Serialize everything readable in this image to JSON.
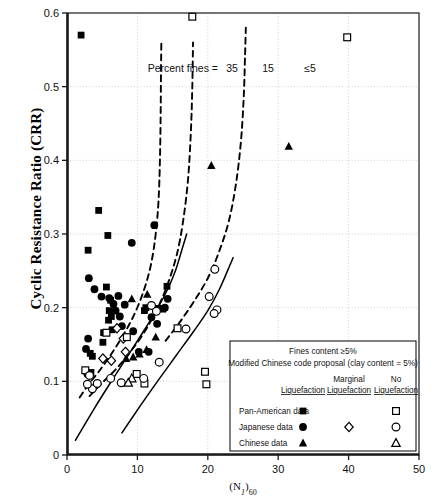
{
  "chart_data": {
    "type": "scatter",
    "title": "",
    "xlabel": "(N1)60",
    "ylabel": "Cyclic Resistance Ratio (CRR)",
    "xlim": [
      0,
      50
    ],
    "ylim": [
      0,
      0.6
    ],
    "xticks": [
      "0",
      "10",
      "20",
      "30",
      "40",
      "50"
    ],
    "xtick_values": [
      0,
      10,
      20,
      30,
      40,
      50
    ],
    "yticks": [
      "0",
      "0.1",
      "0.2",
      "0.3",
      "0.4",
      "0.5",
      "0.6"
    ],
    "ytick_values": [
      0,
      0.1,
      0.2,
      0.3,
      0.4,
      0.5,
      0.6
    ],
    "grid": "dotted-minor",
    "legend_position": "inside-lower-right",
    "annotations": {
      "percent_fines_label": "Percent fines =",
      "curve_labels": [
        "35",
        "15",
        "≤5"
      ]
    },
    "series": [
      {
        "name": "Pan-American data — Liquefaction",
        "marker": "filled-square",
        "points": [
          [
            2.0,
            0.57
          ],
          [
            4.5,
            0.332
          ],
          [
            5.8,
            0.298
          ],
          [
            3.0,
            0.278
          ],
          [
            5.6,
            0.228
          ],
          [
            6.2,
            0.21
          ],
          [
            6.0,
            0.196
          ],
          [
            6.3,
            0.188
          ],
          [
            5.9,
            0.183
          ],
          [
            6.4,
            0.17
          ],
          [
            5.2,
            0.166
          ],
          [
            5.1,
            0.153
          ],
          [
            3.3,
            0.138
          ],
          [
            3.6,
            0.134
          ],
          [
            3.4,
            0.112
          ],
          [
            11.2,
            0.2
          ],
          [
            11.0,
            0.196
          ],
          [
            13.0,
            0.199
          ],
          [
            14.2,
            0.229
          ],
          [
            13.6,
            0.198
          ]
        ]
      },
      {
        "name": "Japanese data — Liquefaction",
        "marker": "filled-circle",
        "points": [
          [
            9.2,
            0.288
          ],
          [
            12.4,
            0.312
          ],
          [
            3.1,
            0.24
          ],
          [
            3.9,
            0.225
          ],
          [
            4.9,
            0.215
          ],
          [
            6.0,
            0.213
          ],
          [
            7.3,
            0.216
          ],
          [
            6.6,
            0.205
          ],
          [
            7.5,
            0.188
          ],
          [
            8.2,
            0.204
          ],
          [
            3.0,
            0.158
          ],
          [
            2.7,
            0.144
          ],
          [
            2.9,
            0.11
          ],
          [
            9.4,
            0.168
          ],
          [
            10.2,
            0.14
          ],
          [
            11.6,
            0.14
          ],
          [
            12.0,
            0.187
          ],
          [
            13.9,
            0.2
          ],
          [
            14.3,
            0.212
          ],
          [
            12.8,
            0.178
          ],
          [
            6.9,
            0.196
          ],
          [
            7.8,
            0.175
          ]
        ]
      },
      {
        "name": "Chinese data — Liquefaction",
        "marker": "filled-triangle",
        "points": [
          [
            20.5,
            0.393
          ],
          [
            31.5,
            0.419
          ],
          [
            11.4,
            0.218
          ],
          [
            9.2,
            0.212
          ],
          [
            10.3,
            0.137
          ],
          [
            12.6,
            0.16
          ],
          [
            9.4,
            0.133
          ],
          [
            8.4,
            0.131
          ],
          [
            11.3,
            0.143
          ]
        ]
      },
      {
        "name": "Japanese data — Marginal Liquefaction",
        "marker": "open-diamond",
        "points": [
          [
            7.1,
            0.172
          ],
          [
            8.0,
            0.158
          ],
          [
            8.3,
            0.14
          ],
          [
            5.1,
            0.131
          ],
          [
            6.3,
            0.128
          ]
        ]
      },
      {
        "name": "Pan-American data — No Liquefaction",
        "marker": "open-square",
        "points": [
          [
            17.8,
            0.595
          ],
          [
            39.8,
            0.567
          ],
          [
            5.6,
            0.166
          ],
          [
            8.5,
            0.16
          ],
          [
            2.6,
            0.115
          ],
          [
            9.9,
            0.11
          ],
          [
            15.7,
            0.172
          ],
          [
            19.6,
            0.113
          ],
          [
            19.8,
            0.096
          ],
          [
            11.0,
            0.097
          ]
        ]
      },
      {
        "name": "Japanese data — No Liquefaction",
        "marker": "open-circle",
        "points": [
          [
            21.0,
            0.252
          ],
          [
            20.2,
            0.215
          ],
          [
            21.3,
            0.197
          ],
          [
            20.9,
            0.192
          ],
          [
            12.0,
            0.203
          ],
          [
            12.7,
            0.195
          ],
          [
            16.9,
            0.171
          ],
          [
            13.1,
            0.126
          ],
          [
            3.2,
            0.108
          ],
          [
            3.6,
            0.09
          ],
          [
            4.3,
            0.097
          ],
          [
            6.2,
            0.104
          ],
          [
            7.7,
            0.098
          ],
          [
            10.9,
            0.104
          ],
          [
            2.9,
            0.096
          ]
        ]
      },
      {
        "name": "Chinese data — No Liquefaction",
        "marker": "open-triangle",
        "points": [
          [
            9.2,
            0.104
          ],
          [
            8.7,
            0.098
          ]
        ]
      }
    ],
    "curves": [
      {
        "name": "CRR curve, percent fines = 35",
        "style": "dashed",
        "label": "35",
        "points": [
          [
            1.8,
            0.078
          ],
          [
            3.0,
            0.095
          ],
          [
            4.5,
            0.113
          ],
          [
            6.0,
            0.133
          ],
          [
            7.5,
            0.155
          ],
          [
            9.0,
            0.18
          ],
          [
            10.2,
            0.205
          ],
          [
            11.2,
            0.232
          ],
          [
            12.0,
            0.262
          ],
          [
            12.6,
            0.3
          ],
          [
            13.0,
            0.345
          ],
          [
            13.2,
            0.4
          ],
          [
            13.3,
            0.46
          ],
          [
            13.35,
            0.52
          ],
          [
            13.4,
            0.56
          ]
        ]
      },
      {
        "name": "CRR curve, percent fines = 15",
        "style": "dashed",
        "label": "15",
        "points": [
          [
            3.2,
            0.08
          ],
          [
            5.0,
            0.098
          ],
          [
            7.0,
            0.117
          ],
          [
            9.0,
            0.14
          ],
          [
            11.0,
            0.167
          ],
          [
            12.8,
            0.198
          ],
          [
            14.3,
            0.232
          ],
          [
            15.6,
            0.272
          ],
          [
            16.5,
            0.318
          ],
          [
            17.2,
            0.375
          ],
          [
            17.6,
            0.44
          ],
          [
            17.8,
            0.5
          ],
          [
            17.9,
            0.56
          ]
        ]
      },
      {
        "name": "CRR curve, percent fines <=5",
        "style": "dashed",
        "label": "≤5",
        "points": [
          [
            14.0,
            0.155
          ],
          [
            16.0,
            0.18
          ],
          [
            18.0,
            0.208
          ],
          [
            20.0,
            0.24
          ],
          [
            21.6,
            0.276
          ],
          [
            23.0,
            0.318
          ],
          [
            24.0,
            0.368
          ],
          [
            24.7,
            0.425
          ],
          [
            25.1,
            0.485
          ],
          [
            25.3,
            0.545
          ],
          [
            25.4,
            0.58
          ]
        ]
      },
      {
        "name": "Solid bounding curve A",
        "style": "solid",
        "points": [
          [
            1.2,
            0.02
          ],
          [
            4.0,
            0.065
          ],
          [
            6.5,
            0.103
          ],
          [
            9.0,
            0.14
          ],
          [
            11.0,
            0.17
          ],
          [
            12.8,
            0.198
          ],
          [
            14.3,
            0.225
          ],
          [
            15.4,
            0.25
          ],
          [
            16.3,
            0.278
          ],
          [
            17.0,
            0.3
          ]
        ]
      },
      {
        "name": "Solid bounding curve B",
        "style": "solid",
        "points": [
          [
            7.8,
            0.03
          ],
          [
            10.5,
            0.068
          ],
          [
            13.0,
            0.102
          ],
          [
            15.5,
            0.135
          ],
          [
            18.0,
            0.168
          ],
          [
            20.0,
            0.196
          ],
          [
            21.6,
            0.224
          ],
          [
            22.8,
            0.25
          ],
          [
            23.6,
            0.268
          ]
        ]
      }
    ]
  },
  "legend": {
    "header_line1": "Fines content ≥5%",
    "header_line2": "Modified Chinese code proposal (clay content = 5%)",
    "columns": [
      {
        "line1": "",
        "line2": "Liquefaction"
      },
      {
        "line1": "Marginal",
        "line2": "Liquefaction"
      },
      {
        "line1": "No",
        "line2": "Liquefaction"
      }
    ],
    "rows": [
      {
        "label": "Pan-American data",
        "liq": "filled-square",
        "marg": "",
        "noliq": "open-square"
      },
      {
        "label": "Japanese data",
        "liq": "filled-circle",
        "marg": "open-diamond",
        "noliq": "open-circle"
      },
      {
        "label": "Chinese data",
        "liq": "filled-triangle",
        "marg": "",
        "noliq": "open-triangle"
      }
    ]
  },
  "axis": {
    "x_title_base": "(N",
    "x_title_sub1": "1",
    "x_title_mid": ")",
    "x_title_sub2": "60",
    "y_title": "Cyclic Resistance Ratio (CRR)"
  },
  "colors": {
    "ink": "#000000",
    "grid": "#bdbdbd",
    "frame": "#1a1a1a",
    "background": "#ffffff"
  }
}
